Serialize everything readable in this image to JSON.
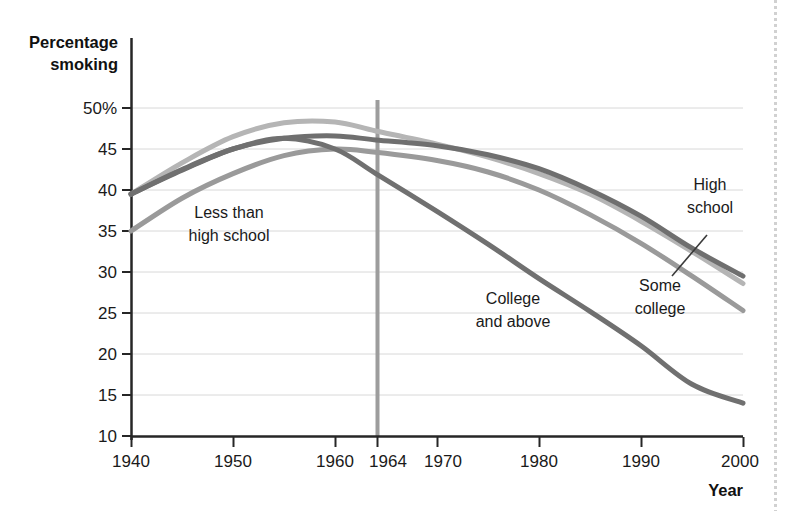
{
  "chart_data": {
    "type": "line",
    "title": "",
    "xlabel": "Year",
    "ylabel": "Percentage smoking",
    "xlim": [
      1940,
      2000
    ],
    "ylim": [
      10,
      50
    ],
    "grid": true,
    "legend_position": "inline-annotations",
    "x_ticks": [
      "1940",
      "1950",
      "1960",
      "1964",
      "1970",
      "1980",
      "1990",
      "2000"
    ],
    "x_tick_values": [
      1940,
      1950,
      1960,
      1964,
      1970,
      1980,
      1990,
      2000
    ],
    "y_ticks": [
      "50%",
      "45",
      "40",
      "35",
      "30",
      "25",
      "20",
      "15",
      "10"
    ],
    "y_tick_values": [
      50,
      45,
      40,
      35,
      30,
      25,
      20,
      15,
      10
    ],
    "annotations": [
      {
        "text_line1": "Less than",
        "text_line2": "high school"
      },
      {
        "text_line1": "College",
        "text_line2": "and above"
      },
      {
        "text_line1": "Some",
        "text_line2": "college"
      },
      {
        "text_line1": "High",
        "text_line2": "school"
      }
    ],
    "marker_year": 1964,
    "x": [
      1940,
      1945,
      1950,
      1955,
      1960,
      1964,
      1970,
      1975,
      1980,
      1985,
      1990,
      1995,
      2000
    ],
    "series": [
      {
        "name": "Less than high school",
        "color": "#9a9a9a",
        "values": [
          35.0,
          39.0,
          42.0,
          44.2,
          45.0,
          44.6,
          43.6,
          42.2,
          40.0,
          37.0,
          33.5,
          29.5,
          25.3
        ]
      },
      {
        "name": "High school",
        "color": "#6f6f6f",
        "values": [
          39.5,
          42.4,
          45.0,
          46.3,
          46.6,
          46.1,
          45.4,
          44.3,
          42.6,
          40.0,
          36.8,
          32.9,
          29.5
        ]
      },
      {
        "name": "Some college",
        "color": "#b5b5b5",
        "values": [
          39.5,
          43.3,
          46.5,
          48.2,
          48.3,
          47.2,
          45.6,
          44.0,
          42.0,
          39.5,
          36.2,
          32.5,
          28.6
        ]
      },
      {
        "name": "College and above",
        "color": "#707070",
        "values": [
          39.5,
          42.5,
          45.0,
          46.3,
          45.0,
          42.0,
          37.4,
          33.4,
          29.2,
          25.2,
          21.0,
          16.3,
          14.0
        ]
      }
    ]
  },
  "axis": {
    "y_title_line1": "Percentage",
    "y_title_line2": "smoking",
    "x_title": "Year"
  }
}
